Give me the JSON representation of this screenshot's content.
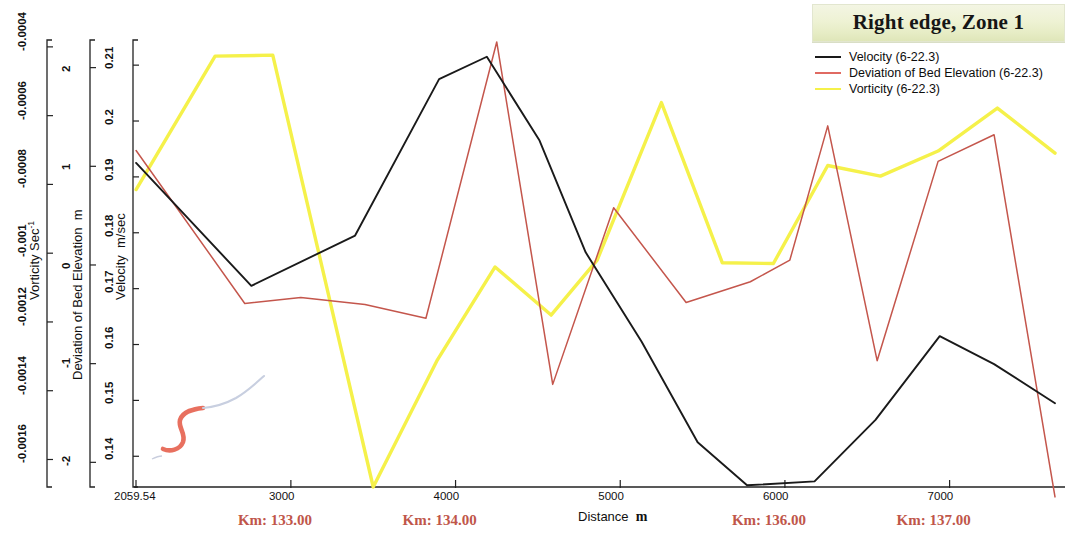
{
  "legend": {
    "title": "Right edge, Zone 1",
    "items": [
      {
        "label": "Velocity (6-22.3)",
        "color": "#1a1a1a"
      },
      {
        "label": "Deviation of Bed Elevation (6-22.3)",
        "color": "#e06a62"
      },
      {
        "label": "Vorticity (6-22.3)",
        "color": "#f5f14a"
      }
    ]
  },
  "chart_data": {
    "type": "line",
    "title": "Right edge, Zone 1",
    "xlabel": "Distance  m",
    "xlim": [
      2059.54,
      7640
    ],
    "grid": false,
    "legend_position": "top-right",
    "x_ticks": [
      "2059.54",
      "3000",
      "4000",
      "5000",
      "6000",
      "7000"
    ],
    "x_tick_values": [
      2059.54,
      3000,
      4000,
      5000,
      6000,
      7000
    ],
    "km_markers": [
      {
        "label": "Km: 133.00",
        "x": 3000
      },
      {
        "label": "Km: 134.00",
        "x": 4000
      },
      {
        "label": "Km: 136.00",
        "x": 6000
      },
      {
        "label": "Km: 137.00",
        "x": 7000
      }
    ],
    "axes": [
      {
        "name": "vorticity",
        "title": "Vorticity  Sec",
        "title_sup": "-1",
        "unit": "Sec^-1",
        "ticks": [
          "-0.0016",
          "-0.0014",
          "-0.0012",
          "-0.001",
          "-0.0008",
          "-0.0006",
          "-0.0004"
        ],
        "tick_values": [
          -0.0016,
          -0.0014,
          -0.0012,
          -0.001,
          -0.0008,
          -0.0006,
          -0.0004
        ],
        "range": [
          -0.00168,
          -0.00038
        ]
      },
      {
        "name": "deviation",
        "title": "Deviation of Bed Elevation",
        "unit": "m",
        "ticks": [
          "-2",
          "-1",
          "0",
          "1",
          "2"
        ],
        "tick_values": [
          -2,
          -1,
          0,
          1,
          2
        ],
        "range": [
          -2.25,
          2.28
        ]
      },
      {
        "name": "velocity",
        "title": "Velocity",
        "unit": "m/sec",
        "ticks": [
          "0.14",
          "0.15",
          "0.16",
          "0.17",
          "0.18",
          "0.19",
          "0.2",
          "0.21"
        ],
        "tick_values": [
          0.14,
          0.15,
          0.16,
          0.17,
          0.18,
          0.19,
          0.2,
          0.21
        ],
        "range": [
          0.1345,
          0.2145
        ]
      }
    ],
    "series": [
      {
        "name": "Velocity (6-22.3)",
        "axis": "velocity",
        "unit": "m/sec",
        "color": "#1a1a1a",
        "x": [
          2060,
          2760,
          3390,
          3900,
          4190,
          4510,
          4790,
          5130,
          5470,
          5770,
          6180,
          6550,
          6940,
          7270,
          7640
        ],
        "y": [
          0.1925,
          0.1705,
          0.1795,
          0.2075,
          0.2115,
          0.1965,
          0.1765,
          0.1605,
          0.1425,
          0.1348,
          0.1355,
          0.1465,
          0.1615,
          0.1565,
          0.1495
        ]
      },
      {
        "name": "Deviation of Bed Elevation (6-22.3)",
        "axis": "deviation",
        "unit": "m",
        "color": "#c4564c",
        "x": [
          2060,
          2720,
          3060,
          3450,
          3820,
          4250,
          4590,
          4960,
          5400,
          5790,
          6030,
          6260,
          6560,
          6930,
          7270,
          7640
        ],
        "y": [
          1.16,
          -0.39,
          -0.33,
          -0.4,
          -0.54,
          2.26,
          -1.21,
          0.58,
          -0.38,
          -0.17,
          0.05,
          1.41,
          -0.97,
          1.05,
          1.32,
          -2.35
        ]
      },
      {
        "name": "Vorticity (6-22.3)",
        "axis": "vorticity",
        "color": "#f5f14a",
        "unit": "Sec^-1",
        "x": [
          2060,
          2540,
          2890,
          3500,
          3890,
          4240,
          4580,
          4860,
          5250,
          5620,
          5930,
          6260,
          6580,
          6930,
          7290,
          7640
        ],
        "y": [
          -0.000815,
          -0.000427,
          -0.000424,
          -0.00168,
          -0.00131,
          -0.00104,
          -0.00118,
          -0.00102,
          -0.000562,
          -0.001028,
          -0.00103,
          -0.000745,
          -0.000776,
          -0.000703,
          -0.000578,
          -0.000709
        ]
      }
    ],
    "inset": {
      "name": "river-reach-sketch",
      "description": "small sketch of channel centerline with highlighted red reach"
    }
  }
}
